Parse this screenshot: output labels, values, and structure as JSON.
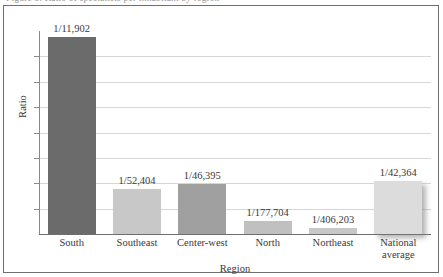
{
  "figure": {
    "caption_sliver": "Figure 3. Ratio of specialists per inhabitant by region",
    "frame_border_color": "#6e6e6e",
    "background": "#ffffff"
  },
  "axes": {
    "y_title": "Ratio",
    "x_title": "Region",
    "gridline_color": "#d6d6d6",
    "axis_color": "#6e6e6e",
    "gridline_count": 7
  },
  "chart_data": {
    "type": "bar",
    "title": "",
    "subtitle": "",
    "xlabel": "Region",
    "ylabel": "Ratio",
    "categories": [
      "South",
      "Southeast",
      "Center-west",
      "North",
      "Northeast",
      "National average"
    ],
    "value_labels": [
      "1/11,902",
      "1/52,404",
      "1/46,395",
      "1/177,704",
      "1/406,203",
      "1/42,364"
    ],
    "denominators": [
      11902,
      52404,
      46395,
      177704,
      406203,
      42364
    ],
    "values": [
      8.40195e-05,
      1.90825e-05,
      2.15541e-05,
      5.6274e-06,
      2.4618e-06,
      2.3605e-05
    ],
    "bar_colors": [
      "#6b6b6b",
      "#c8c8c8",
      "#a0a0a0",
      "#c0c0c0",
      "#c8c8c8",
      "#dcdcdc"
    ],
    "bar_pixel_heights": [
      197,
      45,
      50,
      13,
      6,
      53
    ],
    "ylim": [
      0,
      8.66e-05
    ],
    "grid": true,
    "legend": "none",
    "y_tick_labels": []
  },
  "bars": [
    {
      "category": "South",
      "label": "1/11,902",
      "color": "#6b6b6b",
      "height_pct": 97.0,
      "shadow": false
    },
    {
      "category": "Southeast",
      "label": "1/52,404",
      "color": "#c8c8c8",
      "height_pct": 22.2,
      "shadow": false
    },
    {
      "category": "Center-west",
      "label": "1/46,395",
      "color": "#a0a0a0",
      "height_pct": 24.6,
      "shadow": false
    },
    {
      "category": "North",
      "label": "1/177,704",
      "color": "#c0c0c0",
      "height_pct": 6.4,
      "shadow": false
    },
    {
      "category": "Northeast",
      "label": "1/406,203",
      "color": "#c8c8c8",
      "height_pct": 3.0,
      "shadow": false
    },
    {
      "category": "National average",
      "label": "1/42,364",
      "color": "#dcdcdc",
      "height_pct": 26.1,
      "shadow": true
    }
  ],
  "category_labels": [
    {
      "line1": "South",
      "line2": ""
    },
    {
      "line1": "Southeast",
      "line2": ""
    },
    {
      "line1": "Center-west",
      "line2": ""
    },
    {
      "line1": "North",
      "line2": ""
    },
    {
      "line1": "Northeast",
      "line2": ""
    },
    {
      "line1": "National",
      "line2": "average"
    }
  ]
}
